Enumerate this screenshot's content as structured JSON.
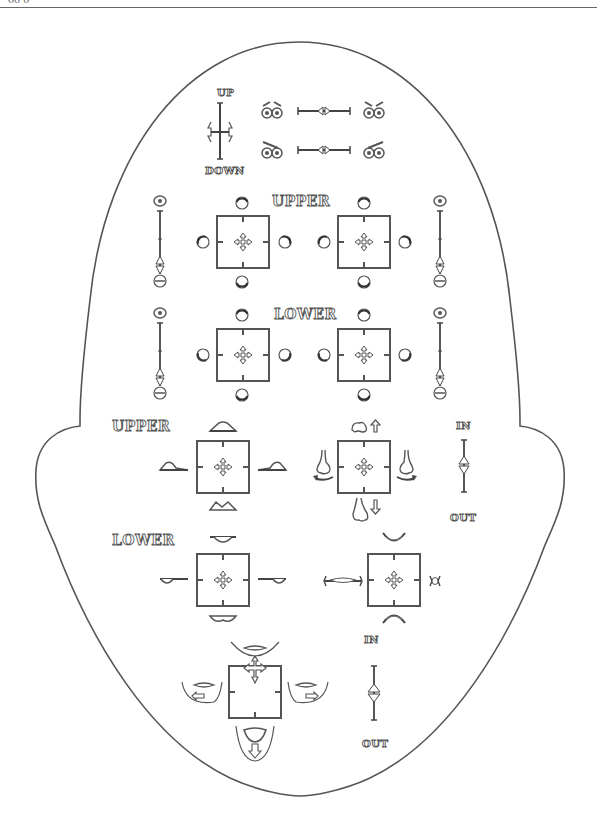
{
  "top_fragment": "őő  ő",
  "head": {
    "labels": {
      "brow_up": "UP",
      "brow_down": "DOWN",
      "eye_upper": "UPPER",
      "eye_lower": "LOWER",
      "lip_upper": "UPPER",
      "lip_lower": "LOWER",
      "nose_in": "IN",
      "nose_out": "OUT",
      "jaw_in": "IN",
      "jaw_out": "OUT"
    }
  },
  "sections": [
    {
      "id": "brows",
      "controls": [
        "brow-updown-slider",
        "brow-inner-slider",
        "brow-outer-slider"
      ]
    },
    {
      "id": "upper-eyelids",
      "controls": [
        "left-upper-eyelid-pad",
        "right-upper-eyelid-pad",
        "left-eye-open-slider",
        "right-eye-open-slider"
      ]
    },
    {
      "id": "lower-eyelids",
      "controls": [
        "left-lower-eyelid-pad",
        "right-lower-eyelid-pad",
        "left-lower-eye-slider",
        "right-lower-eye-slider"
      ]
    },
    {
      "id": "upper-lip",
      "controls": [
        "upper-lip-pad"
      ]
    },
    {
      "id": "nose",
      "controls": [
        "nose-pad",
        "nose-inout-slider"
      ]
    },
    {
      "id": "lower-lip",
      "controls": [
        "lower-lip-pad"
      ]
    },
    {
      "id": "mouth",
      "controls": [
        "mouth-pad"
      ]
    },
    {
      "id": "jaw",
      "controls": [
        "jaw-pad",
        "jaw-inout-slider"
      ]
    }
  ],
  "colors": {
    "stroke": "#555555",
    "background": "#ffffff"
  }
}
